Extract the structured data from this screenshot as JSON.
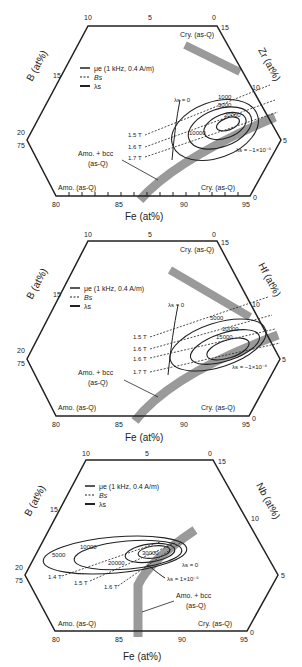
{
  "colors": {
    "line": "#222222",
    "band": "#9a9a9a",
    "background": "#ffffff"
  },
  "legend": {
    "mu": "μe (1 kHz, 0.4 A/m)",
    "bs": "Bs",
    "lambda": "λs"
  },
  "axes": {
    "fe_title": "Fe (at%)",
    "b_title": "B (at%)",
    "fe_ticks": [
      "80",
      "85",
      "90",
      "95"
    ],
    "top_ticks": [
      "10",
      "5",
      "0"
    ],
    "right_ticks": [
      "15",
      "10",
      "5",
      "0"
    ],
    "left_ticks": [
      "20",
      "75"
    ]
  },
  "panels": [
    {
      "element_title": "Zr (at%)",
      "corner_top": "Cry. (as-Q)",
      "corner_bottom_right": "Cry. (as-Q)",
      "corner_bottom_left": "Amo. (as-Q)",
      "band_label_1": "Amo. + bcc",
      "band_label_2": "(as-Q)",
      "lambda_zero": "λs = 0",
      "lambda_neg": "λs = −1×10⁻⁶",
      "bs_lines": [
        "1.5 T",
        "1.6 T",
        "1.7 T"
      ],
      "mu_contours": [
        "1000",
        "5000",
        "10000",
        "20000"
      ]
    },
    {
      "element_title": "Hf (at%)",
      "corner_top": "Cry. (as-Q)",
      "corner_bottom_right": "Cry. (as-Q)",
      "corner_bottom_left": "Amo. (as-Q)",
      "band_label_1": "Amo. + bcc",
      "band_label_2": "(as-Q)",
      "lambda_zero": "λs = 0",
      "lambda_neg": "λs = −1×10⁻⁶",
      "bs_lines": [
        "1.5 T",
        "1.6 T",
        "1.6 T",
        "1.7 T"
      ],
      "mu_contours": [
        "5000",
        "10000",
        "15000"
      ]
    },
    {
      "element_title": "Nb (at%)",
      "corner_top": "",
      "corner_bottom_right": "Cry. (as-Q)",
      "corner_bottom_left": "Amo. (as-Q)",
      "band_label_1": "Amo. + bcc",
      "band_label_2": "(as-Q)",
      "lambda_zero": "λs = 0",
      "lambda_neg": "λs = 1×10⁻⁶",
      "bs_lines": [
        "1.4 T",
        "1.5 T",
        "1.6 T"
      ],
      "mu_contours": [
        "5000",
        "10000",
        "20000",
        "30000"
      ]
    }
  ]
}
